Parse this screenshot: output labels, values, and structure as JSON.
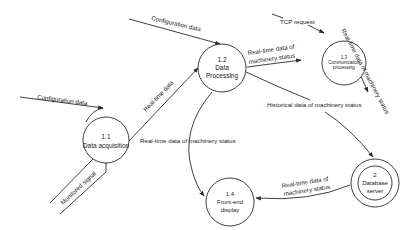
{
  "diagram": {
    "type": "data-flow-diagram",
    "colors": {
      "stroke": "#2a2a2a",
      "text": "#1a1a1a",
      "background": "#ffffff"
    },
    "processes": [
      {
        "id": "1.1",
        "lines": [
          "1.1",
          "Data acquisition"
        ]
      },
      {
        "id": "1.2",
        "lines": [
          "1.2",
          "Data",
          "Processing"
        ]
      },
      {
        "id": "1.3",
        "lines": [
          "1.3",
          "Communication",
          "processing"
        ]
      },
      {
        "id": "1.4",
        "lines": [
          "1.4",
          "Front-end",
          "display"
        ]
      },
      {
        "id": "2",
        "lines": [
          "2",
          "Database",
          "server"
        ]
      }
    ],
    "flows": [
      {
        "label": "Configuration data",
        "from": "external",
        "to": "1.1"
      },
      {
        "label": "Configuration data",
        "from": "external",
        "to": "1.2"
      },
      {
        "label": "Monitored signal",
        "from": "external",
        "to": "1.1"
      },
      {
        "label": "Real-time data",
        "from": "1.1",
        "to": "1.2"
      },
      {
        "label_lines": [
          "Real-time data of",
          "machinery status"
        ],
        "from": "1.2",
        "to": "1.3"
      },
      {
        "label": "TCP request",
        "from": "external",
        "to": "1.3"
      },
      {
        "label": "Real-time data of machinery status",
        "from": "1.3",
        "to": "external"
      },
      {
        "label": "Historical data of machinery status",
        "from": "1.2",
        "to": "2"
      },
      {
        "label": "Real-time data of machinery status",
        "from": "1.2",
        "to": "1.4"
      },
      {
        "label_lines": [
          "Real-time data of",
          "machinery status"
        ],
        "from": "2",
        "to": "1.4"
      }
    ]
  }
}
